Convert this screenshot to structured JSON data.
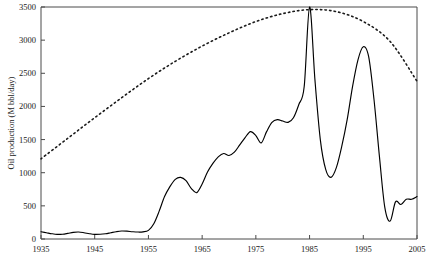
{
  "chart_data": {
    "type": "line",
    "title": "",
    "xlabel": "",
    "ylabel": "Oil production (M bbl/day)",
    "xlim": [
      1935,
      2005
    ],
    "ylim": [
      0,
      3500
    ],
    "grid": false,
    "legend": "none",
    "xticks": [
      1935,
      1945,
      1955,
      1965,
      1975,
      1985,
      1995,
      2005
    ],
    "xtick_labels": [
      "1935",
      "1945",
      "1955",
      "1965",
      "1975",
      "1985",
      "1995",
      "2005"
    ],
    "yticks": [
      0,
      500,
      1000,
      1500,
      2000,
      2500,
      3000,
      3500
    ],
    "ytick_labels": [
      "0",
      "500",
      "1000",
      "1500",
      "2000",
      "2500",
      "3000",
      "3500"
    ],
    "series": [
      {
        "name": "actual-production",
        "style": "solid",
        "color": "#000000",
        "x": [
          1935,
          1936,
          1937,
          1938,
          1939,
          1940,
          1941,
          1942,
          1943,
          1944,
          1945,
          1946,
          1947,
          1948,
          1949,
          1950,
          1951,
          1952,
          1953,
          1954,
          1955,
          1956,
          1957,
          1958,
          1959,
          1960,
          1961,
          1962,
          1963,
          1964,
          1965,
          1966,
          1967,
          1968,
          1969,
          1970,
          1971,
          1972,
          1973,
          1974,
          1975,
          1976,
          1977,
          1978,
          1979,
          1980,
          1981,
          1982,
          1983,
          1984,
          1985,
          1986,
          1987,
          1988,
          1989,
          1990,
          1991,
          1992,
          1993,
          1994,
          1995,
          1996,
          1997,
          1998,
          1999,
          2000,
          2001,
          2002,
          2003,
          2004,
          2005
        ],
        "y": [
          110,
          95,
          80,
          70,
          72,
          85,
          100,
          105,
          95,
          80,
          70,
          72,
          80,
          95,
          110,
          120,
          118,
          110,
          105,
          108,
          130,
          230,
          420,
          640,
          790,
          900,
          930,
          880,
          760,
          700,
          830,
          1010,
          1140,
          1240,
          1290,
          1260,
          1310,
          1420,
          1530,
          1620,
          1560,
          1450,
          1620,
          1760,
          1800,
          1780,
          1760,
          1830,
          2030,
          2300,
          3500,
          2400,
          1500,
          1050,
          930,
          1080,
          1400,
          1800,
          2300,
          2700,
          2900,
          2750,
          2100,
          1250,
          480,
          270,
          560,
          520,
          600,
          600,
          640
        ],
        "y_detail_note": "solid curve is read off the plot; sharp spike to 3500 at 1985 position on the drawn axis"
      },
      {
        "name": "trend-curve",
        "style": "dashed",
        "color": "#1a1a1a",
        "x": [
          1935,
          1940,
          1945,
          1950,
          1955,
          1960,
          1965,
          1970,
          1975,
          1980,
          1985,
          1990,
          1995,
          2000,
          2005
        ],
        "y": [
          1210,
          1520,
          1830,
          2130,
          2420,
          2680,
          2910,
          3110,
          3280,
          3400,
          3460,
          3430,
          3280,
          2980,
          2380
        ]
      }
    ]
  }
}
